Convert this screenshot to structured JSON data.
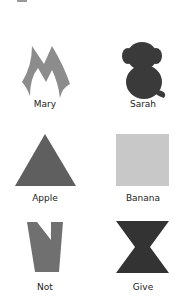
{
  "cards": [
    {
      "label": "Mary",
      "shape": "m-letter-icon",
      "color": "#8c8c8c"
    },
    {
      "label": "Sarah",
      "shape": "monkey-icon",
      "color": "#3a3a3a"
    },
    {
      "label": "Apple",
      "shape": "triangle-icon",
      "color": "#5f5f5f"
    },
    {
      "label": "Banana",
      "shape": "square-icon",
      "color": "#c8c8c8"
    },
    {
      "label": "Not",
      "shape": "notched-trapezoid-icon",
      "color": "#707070"
    },
    {
      "label": "Give",
      "shape": "hourglass-icon",
      "color": "#333333"
    }
  ]
}
